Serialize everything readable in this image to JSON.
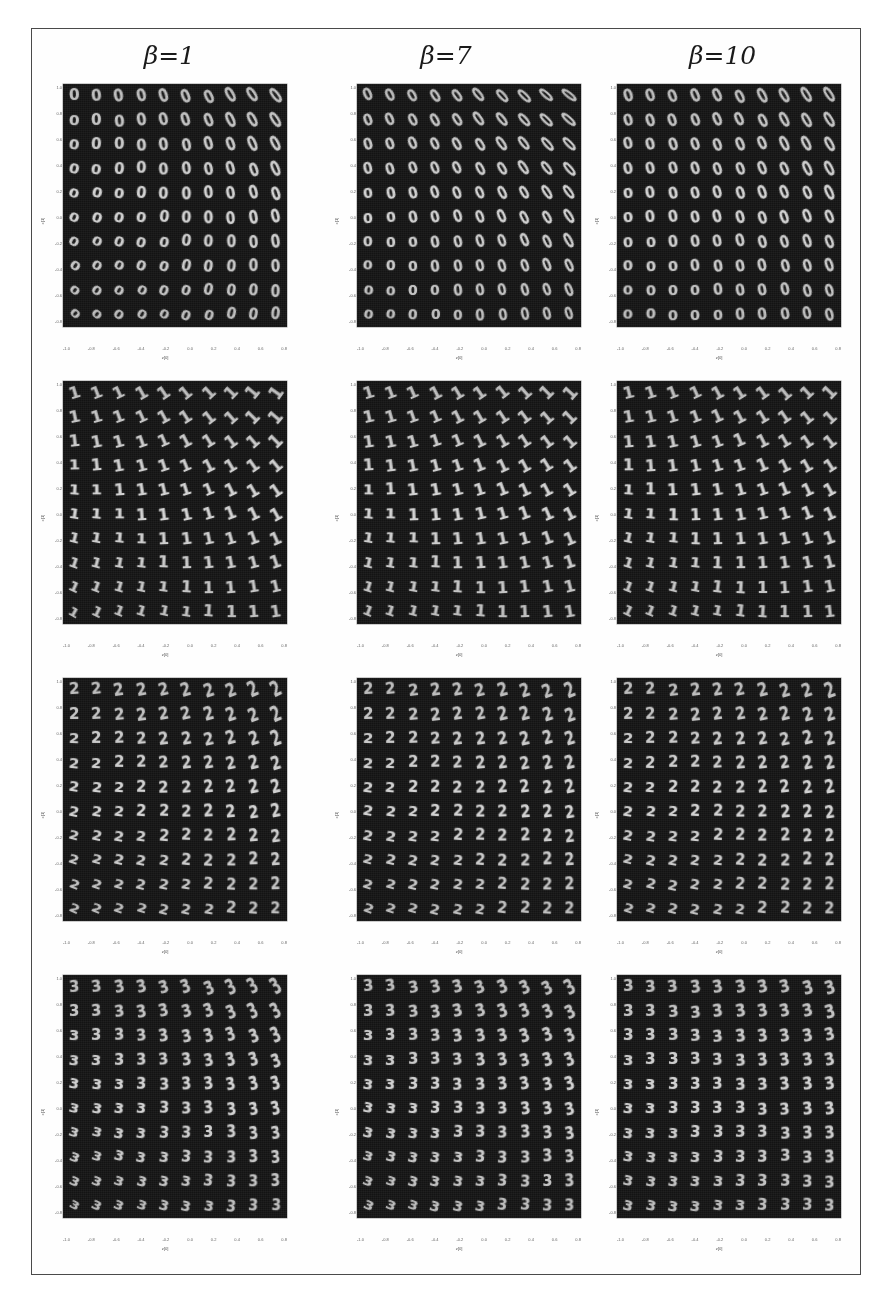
{
  "figure": {
    "background_color": "#ffffff",
    "frame_color": "#4a4a4a",
    "panel_background": "#131313",
    "glyph_color": "#d8d8d8"
  },
  "columns": [
    {
      "id": "beta-1",
      "label": "β=1",
      "beta": 1
    },
    {
      "id": "beta-7",
      "label": "β=7",
      "beta": 7
    },
    {
      "id": "beta-10",
      "label": "β=10",
      "beta": 10
    }
  ],
  "axes": {
    "xlabel": "z[0]",
    "ylabel": "z[1]",
    "xticks": [
      "-1.0",
      "-0.8",
      "-0.6",
      "-0.4",
      "-0.2",
      "0.0",
      "0.2",
      "0.4",
      "0.6",
      "0.8"
    ],
    "yticks": [
      "1.0",
      "0.8",
      "0.6",
      "0.4",
      "0.2",
      "0.0",
      "-0.2",
      "-0.4",
      "-0.6",
      "-0.8"
    ]
  },
  "chart_data": {
    "type": "heatmap",
    "title": "",
    "xlabel": "z[0]",
    "ylabel": "z[1]",
    "xlim": [
      -1.0,
      1.0
    ],
    "ylim": [
      -1.0,
      1.0
    ],
    "grid": false,
    "legend": "none",
    "rows": [
      {
        "digit": "0",
        "row_index": 0
      },
      {
        "digit": "1",
        "row_index": 1
      },
      {
        "digit": "2",
        "row_index": 2
      },
      {
        "digit": "3",
        "row_index": 3
      }
    ],
    "columns": [
      1,
      7,
      10
    ],
    "panels": [
      {
        "digit": "0",
        "beta": 1,
        "rot_min": -38,
        "rot_max": 42,
        "scale_min": 0.8,
        "scale_max": 1.12,
        "stretch_min": 0.72,
        "stretch_max": 1.18
      },
      {
        "digit": "0",
        "beta": 7,
        "rot_min": -52,
        "rot_max": 10,
        "scale_min": 0.82,
        "scale_max": 1.1,
        "stretch_min": 0.6,
        "stretch_max": 1.1
      },
      {
        "digit": "0",
        "beta": 10,
        "rot_min": -34,
        "rot_max": 2,
        "scale_min": 0.86,
        "scale_max": 1.1,
        "stretch_min": 0.7,
        "stretch_max": 1.08
      },
      {
        "digit": "1",
        "beta": 1,
        "rot_min": -55,
        "rot_max": 30,
        "scale_min": 0.9,
        "scale_max": 1.12,
        "stretch_min": 0.92,
        "stretch_max": 1.1
      },
      {
        "digit": "1",
        "beta": 7,
        "rot_min": -48,
        "rot_max": 22,
        "scale_min": 0.92,
        "scale_max": 1.12,
        "stretch_min": 0.94,
        "stretch_max": 1.08
      },
      {
        "digit": "1",
        "beta": 10,
        "rot_min": -46,
        "rot_max": 26,
        "scale_min": 0.92,
        "scale_max": 1.1,
        "stretch_min": 0.94,
        "stretch_max": 1.08
      },
      {
        "digit": "2",
        "beta": 1,
        "rot_min": -26,
        "rot_max": 24,
        "scale_min": 0.82,
        "scale_max": 1.1,
        "stretch_min": 0.78,
        "stretch_max": 1.12
      },
      {
        "digit": "2",
        "beta": 7,
        "rot_min": -22,
        "rot_max": 20,
        "scale_min": 0.84,
        "scale_max": 1.08,
        "stretch_min": 0.8,
        "stretch_max": 1.1
      },
      {
        "digit": "2",
        "beta": 10,
        "rot_min": -20,
        "rot_max": 18,
        "scale_min": 0.84,
        "scale_max": 1.08,
        "stretch_min": 0.82,
        "stretch_max": 1.08
      },
      {
        "digit": "3",
        "beta": 1,
        "rot_min": -30,
        "rot_max": 28,
        "scale_min": 0.8,
        "scale_max": 1.1,
        "stretch_min": 0.74,
        "stretch_max": 1.14
      },
      {
        "digit": "3",
        "beta": 7,
        "rot_min": -28,
        "rot_max": 24,
        "scale_min": 0.84,
        "scale_max": 1.08,
        "stretch_min": 0.8,
        "stretch_max": 1.1
      },
      {
        "digit": "3",
        "beta": 10,
        "rot_min": -16,
        "rot_max": 14,
        "scale_min": 0.88,
        "scale_max": 1.06,
        "stretch_min": 0.88,
        "stretch_max": 1.06
      }
    ],
    "grid_size": [
      10,
      10
    ]
  }
}
